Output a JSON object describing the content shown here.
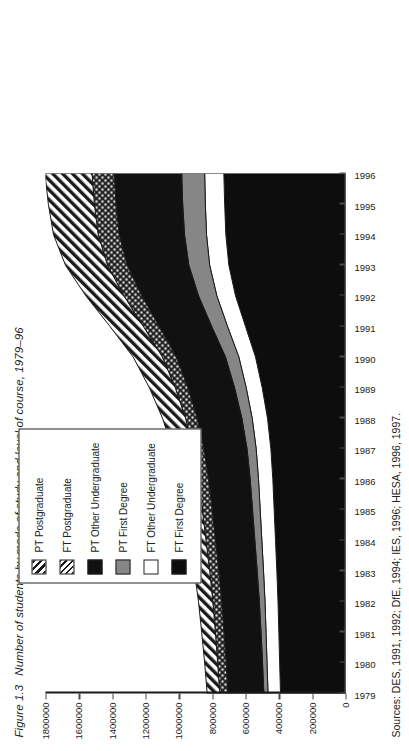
{
  "figure": {
    "number": "Figure 1.3",
    "title": "Number of students by mode of study and level of course, 1979–96"
  },
  "sources": {
    "label": "Sources:",
    "text": "DES, 1991, 1992; DfE, 1994; IES, 1996; HESA, 1996, 1997."
  },
  "legend": {
    "items": [
      {
        "label": "PT Postgraduate",
        "pattern": "diagonal-hatch",
        "color": "#ffffff"
      },
      {
        "label": "FT Postgraduate",
        "pattern": "cross-hatch",
        "color": "#ffffff"
      },
      {
        "label": "PT Other Undergraduate",
        "pattern": "solid",
        "color": "#111111"
      },
      {
        "label": "PT First Degree",
        "pattern": "solid",
        "color": "#868686"
      },
      {
        "label": "FT Other Undergraduate",
        "pattern": "solid",
        "color": "#ffffff"
      },
      {
        "label": "FT First Degree",
        "pattern": "solid",
        "color": "#0d0d0d"
      }
    ]
  },
  "chart_data": {
    "type": "area",
    "title": "Number of students by mode of study and level of course, 1979–96",
    "xlabel": "",
    "ylabel": "",
    "stacked": true,
    "grid": false,
    "legend_position": "top-right",
    "ylim": [
      0,
      1800000
    ],
    "yticks": [
      0,
      200000,
      400000,
      600000,
      800000,
      1000000,
      1200000,
      1400000,
      1600000,
      1800000
    ],
    "ytick_labels": [
      "0",
      "200000",
      "400000",
      "600000",
      "800000",
      "1000000",
      "1200000",
      "1400000",
      "1600000",
      "1800000"
    ],
    "categories": [
      1979,
      1980,
      1981,
      1982,
      1983,
      1984,
      1985,
      1986,
      1987,
      1988,
      1989,
      1990,
      1991,
      1992,
      1993,
      1994,
      1995,
      1996
    ],
    "series": [
      {
        "name": "FT First Degree",
        "pattern": "solid",
        "color": "#0d0d0d",
        "values": [
          390000,
          395000,
          400000,
          405000,
          412000,
          420000,
          428000,
          436000,
          448000,
          468000,
          500000,
          540000,
          600000,
          660000,
          700000,
          718000,
          725000,
          730000
        ]
      },
      {
        "name": "FT Other Undergraduate",
        "pattern": "solid",
        "color": "#ffffff",
        "values": [
          75000,
          76000,
          77000,
          78000,
          80000,
          82000,
          84000,
          86000,
          88000,
          92000,
          96000,
          100000,
          108000,
          112000,
          115000,
          116000,
          116000,
          115000
        ]
      },
      {
        "name": "PT First Degree",
        "pattern": "solid",
        "color": "#868686",
        "values": [
          25000,
          27000,
          30000,
          34000,
          38000,
          42000,
          46000,
          50000,
          55000,
          62000,
          70000,
          80000,
          95000,
          110000,
          125000,
          132000,
          136000,
          138000
        ]
      },
      {
        "name": "PT Other Undergraduate",
        "pattern": "solid",
        "color": "#111111",
        "values": [
          215000,
          218000,
          222000,
          226000,
          230000,
          236000,
          242000,
          250000,
          258000,
          268000,
          280000,
          295000,
          315000,
          340000,
          370000,
          392000,
          400000,
          405000
        ]
      },
      {
        "name": "FT Postgraduate",
        "pattern": "cross-hatch",
        "color": "#ffffff",
        "values": [
          50000,
          51000,
          52000,
          53000,
          55000,
          57000,
          59000,
          62000,
          65000,
          70000,
          76000,
          84000,
          95000,
          108000,
          118000,
          126000,
          130000,
          133000
        ]
      },
      {
        "name": "PT Postgraduate",
        "pattern": "diagonal-hatch",
        "color": "#ffffff",
        "values": [
          75000,
          78000,
          82000,
          86000,
          92000,
          98000,
          106000,
          114000,
          124000,
          138000,
          155000,
          175000,
          200000,
          228000,
          252000,
          268000,
          276000,
          282000
        ]
      }
    ]
  }
}
